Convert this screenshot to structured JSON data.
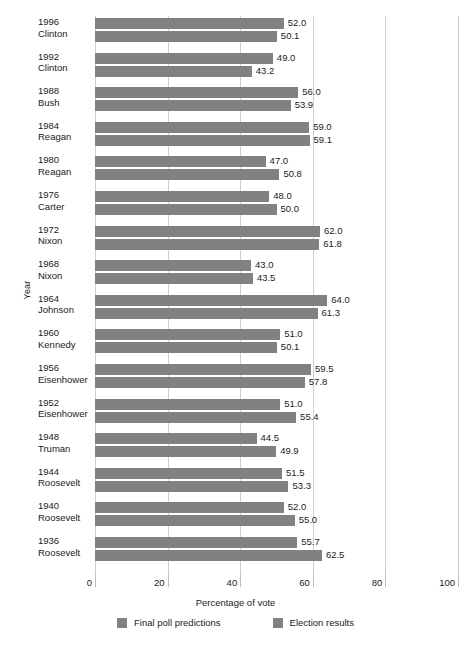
{
  "chart_data": {
    "type": "bar",
    "orientation": "horizontal",
    "title": "",
    "xlabel": "Percentage of vote",
    "ylabel": "Year",
    "xlim": [
      0,
      100
    ],
    "xticks": [
      0,
      20,
      40,
      60,
      80,
      100
    ],
    "xtick_labels": [
      "0",
      "20",
      "40",
      "60",
      "80",
      "100"
    ],
    "grid": true,
    "legend_position": "bottom",
    "bar_color": "#818181",
    "categories": [
      "1996\nClinton",
      "1992\nClinton",
      "1988\nBush",
      "1984\nReagan",
      "1980\nReagan",
      "1976\nCarter",
      "1972\nNixon",
      "1968\nNixon",
      "1964\nJohnson",
      "1960\nKennedy",
      "1956\nEisenhower",
      "1952\nEisenhower",
      "1948\nTruman",
      "1944\nRoosevelt",
      "1940\nRoosevelt",
      "1936\nRoosevelt"
    ],
    "series": [
      {
        "name": "Final poll predictions",
        "values": [
          52.0,
          49.0,
          56.0,
          59.0,
          47.0,
          48.0,
          62.0,
          43.0,
          64.0,
          51.0,
          59.5,
          51.0,
          44.5,
          51.5,
          52.0,
          55.7
        ]
      },
      {
        "name": "Election results",
        "values": [
          50.1,
          43.2,
          53.9,
          59.1,
          50.8,
          50.0,
          61.8,
          43.5,
          61.3,
          50.1,
          57.8,
          55.4,
          49.9,
          53.3,
          55.0,
          62.5
        ]
      }
    ]
  },
  "rows": [
    {
      "year": "1996",
      "person": "Clinton",
      "poll": "52.0",
      "result": "50.1",
      "poll_v": 52.0,
      "result_v": 50.1
    },
    {
      "year": "1992",
      "person": "Clinton",
      "poll": "49.0",
      "result": "43.2",
      "poll_v": 49.0,
      "result_v": 43.2
    },
    {
      "year": "1988",
      "person": "Bush",
      "poll": "56.0",
      "result": "53.9",
      "poll_v": 56.0,
      "result_v": 53.9
    },
    {
      "year": "1984",
      "person": "Reagan",
      "poll": "59.0",
      "result": "59.1",
      "poll_v": 59.0,
      "result_v": 59.1
    },
    {
      "year": "1980",
      "person": "Reagan",
      "poll": "47.0",
      "result": "50.8",
      "poll_v": 47.0,
      "result_v": 50.8
    },
    {
      "year": "1976",
      "person": "Carter",
      "poll": "48.0",
      "result": "50.0",
      "poll_v": 48.0,
      "result_v": 50.0
    },
    {
      "year": "1972",
      "person": "Nixon",
      "poll": "62.0",
      "result": "61.8",
      "poll_v": 62.0,
      "result_v": 61.8
    },
    {
      "year": "1968",
      "person": "Nixon",
      "poll": "43.0",
      "result": "43.5",
      "poll_v": 43.0,
      "result_v": 43.5
    },
    {
      "year": "1964",
      "person": "Johnson",
      "poll": "64.0",
      "result": "61.3",
      "poll_v": 64.0,
      "result_v": 61.3
    },
    {
      "year": "1960",
      "person": "Kennedy",
      "poll": "51.0",
      "result": "50.1",
      "poll_v": 51.0,
      "result_v": 50.1
    },
    {
      "year": "1956",
      "person": "Eisenhower",
      "poll": "59.5",
      "result": "57.8",
      "poll_v": 59.5,
      "result_v": 57.8
    },
    {
      "year": "1952",
      "person": "Eisenhower",
      "poll": "51.0",
      "result": "55.4",
      "poll_v": 51.0,
      "result_v": 55.4
    },
    {
      "year": "1948",
      "person": "Truman",
      "poll": "44.5",
      "result": "49.9",
      "poll_v": 44.5,
      "result_v": 49.9
    },
    {
      "year": "1944",
      "person": "Roosevelt",
      "poll": "51.5",
      "result": "53.3",
      "poll_v": 51.5,
      "result_v": 53.3
    },
    {
      "year": "1940",
      "person": "Roosevelt",
      "poll": "52.0",
      "result": "55.0",
      "poll_v": 52.0,
      "result_v": 55.0
    },
    {
      "year": "1936",
      "person": "Roosevelt",
      "poll": "55.7",
      "result": "62.5",
      "poll_v": 55.7,
      "result_v": 62.5
    }
  ],
  "axes": {
    "y_title": "Year",
    "x_title": "Percentage of vote",
    "x_ticks": [
      "0",
      "20",
      "40",
      "60",
      "80",
      "100"
    ]
  },
  "legend": {
    "items": [
      {
        "label": "Final poll predictions",
        "color": "#818181"
      },
      {
        "label": "Election results",
        "color": "#818181"
      }
    ]
  }
}
